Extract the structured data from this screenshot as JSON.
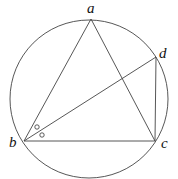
{
  "diagram": {
    "type": "inscribed-quadrilateral-in-circle",
    "circle": {
      "cx": 89,
      "cy": 99,
      "r": 79
    },
    "points": {
      "a": {
        "label": "a",
        "x": 91,
        "y": 19,
        "lx": 87,
        "ly": 13
      },
      "b": {
        "label": "b",
        "x": 24,
        "y": 141,
        "lx": 9,
        "ly": 147
      },
      "c": {
        "label": "c",
        "x": 155,
        "y": 141,
        "lx": 161,
        "ly": 148
      },
      "d": {
        "label": "d",
        "x": 156,
        "y": 57,
        "lx": 159,
        "ly": 58
      }
    },
    "segments": [
      {
        "from": "a",
        "to": "b"
      },
      {
        "from": "a",
        "to": "c"
      },
      {
        "from": "b",
        "to": "c"
      },
      {
        "from": "b",
        "to": "d"
      },
      {
        "from": "d",
        "to": "c"
      }
    ],
    "angle_marks": [
      {
        "name": "angle-abd-mark",
        "x": 37,
        "y": 127,
        "r": 2.2
      },
      {
        "name": "angle-dbc-mark",
        "x": 42,
        "y": 135,
        "r": 2.2
      }
    ]
  }
}
